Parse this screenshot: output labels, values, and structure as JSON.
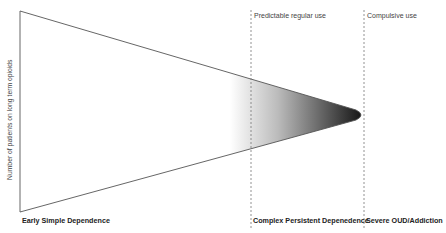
{
  "diagram": {
    "y_axis_label": "Number of patients on long term opioids",
    "top_labels": [
      "Predictable regular use",
      "Compulsive use"
    ],
    "bottom_labels": [
      "Early Simple Dependence",
      "Complex Persistent Depenedence",
      "Severe OUD/Addiction"
    ],
    "colors": {
      "outline": "#555555",
      "gradient_end": "#111111",
      "dashed": "#777777"
    }
  }
}
